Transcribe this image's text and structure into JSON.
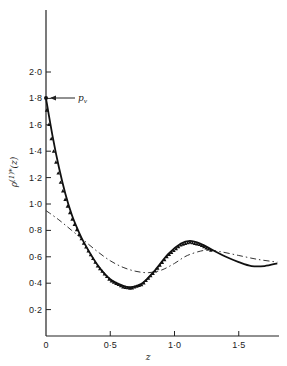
{
  "chart_data": {
    "type": "line",
    "title": "",
    "xlabel": "z",
    "ylabel": "ρ(1)*(z)",
    "xlim": [
      0,
      1.8
    ],
    "ylim": [
      0,
      2.4
    ],
    "grid": false,
    "legend": null,
    "x_ticks": [
      "0",
      "0·5",
      "1·0",
      "1·5"
    ],
    "x_tick_values": [
      0,
      0.5,
      1.0,
      1.5
    ],
    "y_ticks": [
      "0·2",
      "0·4",
      "0·6",
      "0·8",
      "1·0",
      "1·2",
      "1·4",
      "1·6",
      "1·8",
      "2·0"
    ],
    "y_tick_values": [
      0.2,
      0.4,
      0.6,
      0.8,
      1.0,
      1.2,
      1.4,
      1.6,
      1.8,
      2.0
    ],
    "annotations": [
      {
        "text": "p_v",
        "x": 0,
        "y": 1.8,
        "style": "arrow pointing left to y-axis"
      }
    ],
    "series": [
      {
        "name": "solid",
        "style": "solid",
        "x": [
          0,
          0.05,
          0.1,
          0.15,
          0.2,
          0.25,
          0.3,
          0.4,
          0.5,
          0.6,
          0.66,
          0.75,
          0.85,
          0.95,
          1.05,
          1.12,
          1.2,
          1.3,
          1.4,
          1.5,
          1.6,
          1.7,
          1.8
        ],
        "y": [
          1.8,
          1.52,
          1.28,
          1.08,
          0.92,
          0.8,
          0.7,
          0.54,
          0.43,
          0.38,
          0.37,
          0.4,
          0.5,
          0.62,
          0.7,
          0.72,
          0.7,
          0.65,
          0.6,
          0.56,
          0.53,
          0.53,
          0.55
        ]
      },
      {
        "name": "points",
        "style": "markers (triangles)",
        "x": [
          0,
          0.05,
          0.1,
          0.15,
          0.2,
          0.25,
          0.3,
          0.4,
          0.5,
          0.6,
          0.66,
          0.75,
          0.85,
          0.95,
          1.05,
          1.12,
          1.2,
          1.3
        ],
        "y": [
          1.75,
          1.45,
          1.22,
          1.04,
          0.9,
          0.79,
          0.7,
          0.54,
          0.43,
          0.38,
          0.37,
          0.4,
          0.5,
          0.62,
          0.7,
          0.72,
          0.7,
          0.65
        ]
      },
      {
        "name": "dash-dot",
        "style": "dash-dot",
        "x": [
          0,
          0.1,
          0.2,
          0.3,
          0.4,
          0.5,
          0.6,
          0.7,
          0.8,
          0.9,
          1.0,
          1.1,
          1.24,
          1.35,
          1.5,
          1.65,
          1.8
        ],
        "y": [
          0.95,
          0.88,
          0.8,
          0.72,
          0.64,
          0.57,
          0.52,
          0.49,
          0.48,
          0.5,
          0.55,
          0.61,
          0.65,
          0.64,
          0.61,
          0.58,
          0.56
        ]
      }
    ]
  }
}
